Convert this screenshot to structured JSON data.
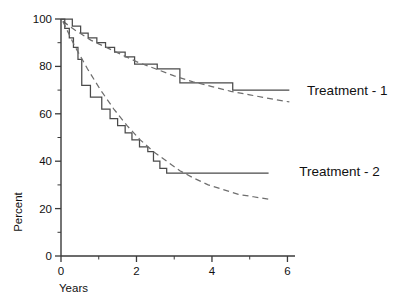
{
  "chart_data": {
    "type": "line",
    "title": "",
    "xlabel": "Years",
    "ylabel": "Percent",
    "xlim": [
      0,
      6.2
    ],
    "ylim": [
      0,
      100
    ],
    "grid": false,
    "legend_position": "right-inline",
    "x_ticks_major": [
      0,
      2,
      4,
      6
    ],
    "x_tick_labels": [
      "0",
      "2",
      "4",
      "6"
    ],
    "x_ticks_minor": [
      1,
      3,
      5
    ],
    "y_ticks_major": [
      0,
      20,
      40,
      60,
      80,
      100
    ],
    "y_tick_labels": [
      "0",
      "20",
      "40",
      "60",
      "80",
      "100"
    ],
    "y_ticks_minor": [
      10,
      30,
      50,
      70,
      90
    ],
    "series": [
      {
        "name": "Treatment - 1",
        "style": "step",
        "label": "Treatment - 1",
        "label_x": 6.25,
        "label_y": 70,
        "points": [
          [
            0.0,
            100
          ],
          [
            0.3,
            100
          ],
          [
            0.3,
            97
          ],
          [
            0.52,
            97
          ],
          [
            0.52,
            94
          ],
          [
            0.72,
            94
          ],
          [
            0.72,
            92
          ],
          [
            0.95,
            92
          ],
          [
            0.95,
            90
          ],
          [
            1.18,
            90
          ],
          [
            1.18,
            88
          ],
          [
            1.42,
            88
          ],
          [
            1.42,
            86
          ],
          [
            1.7,
            86
          ],
          [
            1.7,
            84
          ],
          [
            1.95,
            84
          ],
          [
            1.95,
            81
          ],
          [
            2.55,
            81
          ],
          [
            2.55,
            79
          ],
          [
            3.15,
            79
          ],
          [
            3.15,
            73
          ],
          [
            4.55,
            73
          ],
          [
            4.55,
            70
          ],
          [
            6.05,
            70
          ]
        ]
      },
      {
        "name": "Treatment - 1 fitted",
        "style": "dashed-fit",
        "points": [
          [
            0.05,
            99
          ],
          [
            0.4,
            95
          ],
          [
            0.8,
            91
          ],
          [
            1.2,
            88
          ],
          [
            1.6,
            85
          ],
          [
            2.0,
            82
          ],
          [
            2.5,
            79
          ],
          [
            3.0,
            76
          ],
          [
            3.5,
            73.5
          ],
          [
            4.0,
            71.5
          ],
          [
            4.5,
            69.5
          ],
          [
            5.0,
            68
          ],
          [
            5.5,
            66.5
          ],
          [
            6.05,
            65
          ]
        ]
      },
      {
        "name": "Treatment - 2",
        "style": "step",
        "label": "Treatment - 2",
        "label_x": 6.05,
        "label_y": 36,
        "points": [
          [
            0.0,
            100
          ],
          [
            0.1,
            100
          ],
          [
            0.1,
            96
          ],
          [
            0.22,
            96
          ],
          [
            0.22,
            92
          ],
          [
            0.33,
            92
          ],
          [
            0.33,
            88
          ],
          [
            0.45,
            88
          ],
          [
            0.45,
            83
          ],
          [
            0.55,
            83
          ],
          [
            0.55,
            72
          ],
          [
            0.78,
            72
          ],
          [
            0.78,
            67
          ],
          [
            1.08,
            67
          ],
          [
            1.08,
            62
          ],
          [
            1.3,
            62
          ],
          [
            1.3,
            58
          ],
          [
            1.5,
            58
          ],
          [
            1.5,
            55
          ],
          [
            1.7,
            55
          ],
          [
            1.7,
            52
          ],
          [
            1.88,
            52
          ],
          [
            1.88,
            49
          ],
          [
            2.08,
            49
          ],
          [
            2.08,
            46
          ],
          [
            2.3,
            46
          ],
          [
            2.3,
            44
          ],
          [
            2.45,
            44
          ],
          [
            2.45,
            40
          ],
          [
            2.62,
            40
          ],
          [
            2.62,
            37
          ],
          [
            2.8,
            37
          ],
          [
            2.8,
            35
          ],
          [
            5.5,
            35
          ]
        ]
      },
      {
        "name": "Treatment - 2 fitted",
        "style": "dashed-fit",
        "points": [
          [
            0.05,
            99
          ],
          [
            0.35,
            89
          ],
          [
            0.7,
            79
          ],
          [
            1.05,
            70
          ],
          [
            1.4,
            62
          ],
          [
            1.75,
            55
          ],
          [
            2.1,
            49
          ],
          [
            2.45,
            44
          ],
          [
            2.8,
            40
          ],
          [
            3.15,
            36
          ],
          [
            3.5,
            33
          ],
          [
            3.9,
            30
          ],
          [
            4.3,
            28
          ],
          [
            4.7,
            26
          ],
          [
            5.1,
            25
          ],
          [
            5.5,
            24
          ]
        ]
      }
    ]
  },
  "geometry": {
    "plot_left": 61,
    "plot_right": 295,
    "plot_top": 19,
    "plot_bottom": 256
  }
}
